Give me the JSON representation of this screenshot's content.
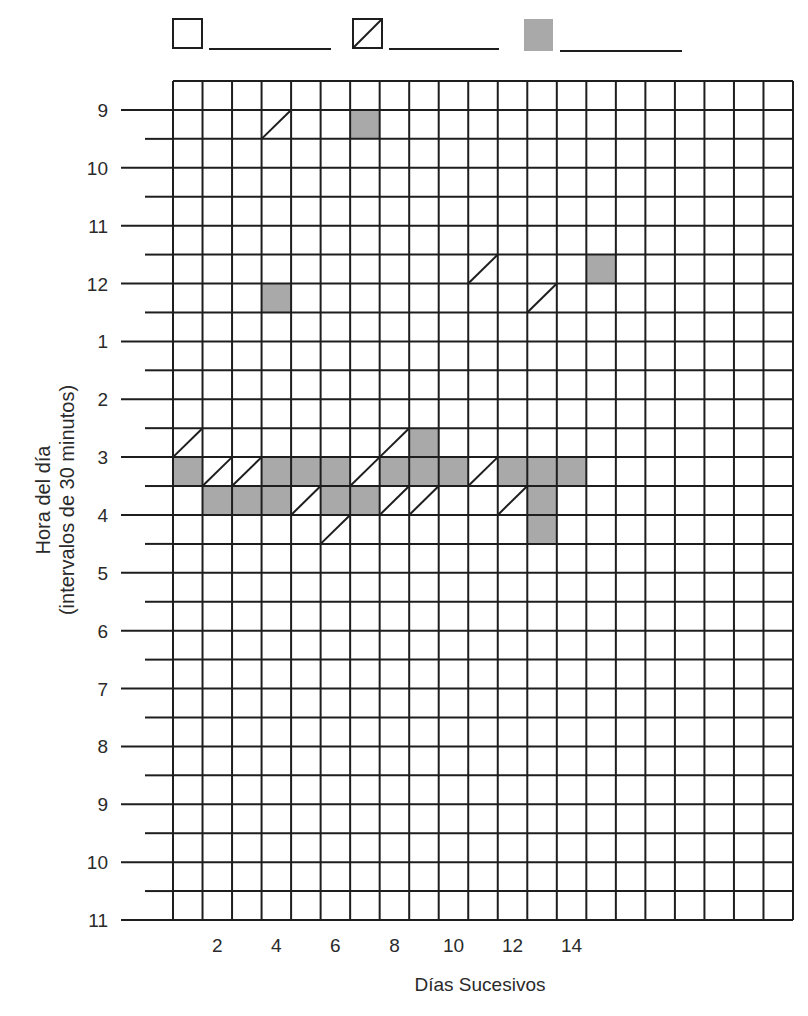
{
  "chart_data": {
    "type": "heatmap",
    "title": "",
    "xlabel": "Días Sucesivos",
    "ylabel_lines": [
      "Hora del día",
      "(intervalos de 30 minutos)"
    ],
    "x_tick_labels": [
      {
        "day": 2,
        "label": "2"
      },
      {
        "day": 4,
        "label": "4"
      },
      {
        "day": 6,
        "label": "6"
      },
      {
        "day": 8,
        "label": "8"
      },
      {
        "day": 10,
        "label": "10"
      },
      {
        "day": 12,
        "label": "12"
      },
      {
        "day": 14,
        "label": "14"
      }
    ],
    "y_tick_labels": [
      "9",
      "10",
      "11",
      "12",
      "1",
      "2",
      "3",
      "4",
      "5",
      "6",
      "7",
      "8",
      "9",
      "10",
      "11"
    ],
    "columns": 21,
    "rows": 29,
    "row_interval_minutes": 30,
    "grid": true,
    "legend": {
      "position": "top",
      "entries": [
        {
          "symbol": "empty",
          "label": ""
        },
        {
          "symbol": "diagonal",
          "label": ""
        },
        {
          "symbol": "filled",
          "label": ""
        }
      ]
    },
    "cells": [
      {
        "day": 4,
        "row": 1,
        "start": "9:00",
        "state": "diagonal"
      },
      {
        "day": 7,
        "row": 1,
        "start": "9:00",
        "state": "filled"
      },
      {
        "day": 11,
        "row": 6,
        "start": "11:30",
        "state": "diagonal"
      },
      {
        "day": 15,
        "row": 6,
        "start": "11:30",
        "state": "filled"
      },
      {
        "day": 4,
        "row": 7,
        "start": "12:00",
        "state": "filled"
      },
      {
        "day": 13,
        "row": 7,
        "start": "12:00",
        "state": "diagonal"
      },
      {
        "day": 1,
        "row": 12,
        "start": "2:30",
        "state": "diagonal"
      },
      {
        "day": 8,
        "row": 12,
        "start": "2:30",
        "state": "diagonal"
      },
      {
        "day": 9,
        "row": 12,
        "start": "2:30",
        "state": "filled"
      },
      {
        "day": 1,
        "row": 13,
        "start": "3:00",
        "state": "filled"
      },
      {
        "day": 2,
        "row": 13,
        "start": "3:00",
        "state": "diagonal"
      },
      {
        "day": 3,
        "row": 13,
        "start": "3:00",
        "state": "diagonal"
      },
      {
        "day": 4,
        "row": 13,
        "start": "3:00",
        "state": "filled"
      },
      {
        "day": 5,
        "row": 13,
        "start": "3:00",
        "state": "filled"
      },
      {
        "day": 6,
        "row": 13,
        "start": "3:00",
        "state": "filled"
      },
      {
        "day": 7,
        "row": 13,
        "start": "3:00",
        "state": "diagonal"
      },
      {
        "day": 8,
        "row": 13,
        "start": "3:00",
        "state": "filled"
      },
      {
        "day": 9,
        "row": 13,
        "start": "3:00",
        "state": "filled"
      },
      {
        "day": 10,
        "row": 13,
        "start": "3:00",
        "state": "filled"
      },
      {
        "day": 11,
        "row": 13,
        "start": "3:00",
        "state": "diagonal"
      },
      {
        "day": 12,
        "row": 13,
        "start": "3:00",
        "state": "filled"
      },
      {
        "day": 13,
        "row": 13,
        "start": "3:00",
        "state": "filled"
      },
      {
        "day": 14,
        "row": 13,
        "start": "3:00",
        "state": "filled"
      },
      {
        "day": 2,
        "row": 14,
        "start": "3:30",
        "state": "filled"
      },
      {
        "day": 3,
        "row": 14,
        "start": "3:30",
        "state": "filled"
      },
      {
        "day": 4,
        "row": 14,
        "start": "3:30",
        "state": "filled"
      },
      {
        "day": 5,
        "row": 14,
        "start": "3:30",
        "state": "diagonal"
      },
      {
        "day": 6,
        "row": 14,
        "start": "3:30",
        "state": "filled"
      },
      {
        "day": 7,
        "row": 14,
        "start": "3:30",
        "state": "filled"
      },
      {
        "day": 8,
        "row": 14,
        "start": "3:30",
        "state": "diagonal"
      },
      {
        "day": 9,
        "row": 14,
        "start": "3:30",
        "state": "diagonal"
      },
      {
        "day": 12,
        "row": 14,
        "start": "3:30",
        "state": "diagonal"
      },
      {
        "day": 13,
        "row": 14,
        "start": "3:30",
        "state": "filled"
      },
      {
        "day": 6,
        "row": 15,
        "start": "4:00",
        "state": "diagonal"
      },
      {
        "day": 13,
        "row": 15,
        "start": "4:00",
        "state": "filled"
      }
    ]
  },
  "colors": {
    "grid_line": "#1e1e1e",
    "filled_cell": "#a9a9a9",
    "background": "#ffffff"
  }
}
